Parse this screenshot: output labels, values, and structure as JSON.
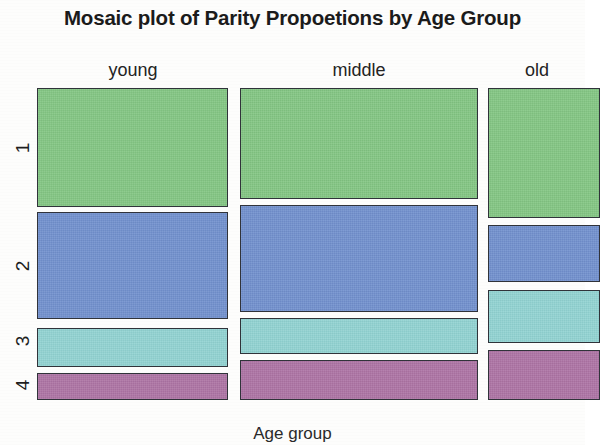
{
  "title": "Mosaic plot of Parity Propoetions by Age Group",
  "x_axis_title": "Age group",
  "columns": [
    {
      "label": "young",
      "label_center_x": 133
    },
    {
      "label": "middle",
      "label_center_x": 359
    },
    {
      "label": "old",
      "label_center_x": 537
    }
  ],
  "rows": [
    {
      "label": "1"
    },
    {
      "label": "2"
    },
    {
      "label": "3"
    },
    {
      "label": "4"
    }
  ],
  "colors": {
    "parity_1": "#83c683",
    "parity_2": "#7190ce",
    "parity_3": "#91d3d2",
    "parity_4": "#ad73a4",
    "tile_border": "#30333a",
    "background": "#fdfdfc",
    "text": "#1b1b1b"
  },
  "chart_data": {
    "type": "bar",
    "chart_kind": "mosaic",
    "title": "Mosaic plot of Parity Propoetions by Age Group",
    "xlabel": "Age group",
    "ylabel": "Parity",
    "categories": [
      "young",
      "middle",
      "old"
    ],
    "row_categories": [
      "1",
      "2",
      "3",
      "4"
    ],
    "column_widths_fraction": [
      0.351,
      0.437,
      0.212
    ],
    "legend": "none",
    "grid": false,
    "series": [
      {
        "name": "1",
        "values": [
          0.385,
          0.358,
          0.417
        ]
      },
      {
        "name": "2",
        "values": [
          0.346,
          0.343,
          0.185
        ]
      },
      {
        "name": "3",
        "values": [
          0.128,
          0.115,
          0.173
        ]
      },
      {
        "name": "4",
        "values": [
          0.087,
          0.129,
          0.161
        ]
      }
    ],
    "tiles": [
      {
        "column": "young",
        "row": "1",
        "color": "#83c683",
        "x": 37,
        "y": 88,
        "width": 191,
        "height": 119
      },
      {
        "column": "young",
        "row": "2",
        "color": "#7190ce",
        "x": 37,
        "y": 212,
        "width": 191,
        "height": 107
      },
      {
        "column": "young",
        "row": "3",
        "color": "#91d3d2",
        "x": 37,
        "y": 328,
        "width": 191,
        "height": 39
      },
      {
        "column": "young",
        "row": "4",
        "color": "#ad73a4",
        "x": 37,
        "y": 373,
        "width": 191,
        "height": 27
      },
      {
        "column": "middle",
        "row": "1",
        "color": "#83c683",
        "x": 240,
        "y": 88,
        "width": 238,
        "height": 111
      },
      {
        "column": "middle",
        "row": "2",
        "color": "#7190ce",
        "x": 240,
        "y": 205,
        "width": 238,
        "height": 107
      },
      {
        "column": "middle",
        "row": "3",
        "color": "#91d3d2",
        "x": 240,
        "y": 318,
        "width": 238,
        "height": 36
      },
      {
        "column": "middle",
        "row": "4",
        "color": "#ad73a4",
        "x": 240,
        "y": 360,
        "width": 238,
        "height": 40
      },
      {
        "column": "old",
        "row": "1",
        "color": "#83c683",
        "x": 488,
        "y": 88,
        "width": 112,
        "height": 130
      },
      {
        "column": "old",
        "row": "2",
        "color": "#7190ce",
        "x": 488,
        "y": 225,
        "width": 112,
        "height": 57
      },
      {
        "column": "old",
        "row": "3",
        "color": "#91d3d2",
        "x": 488,
        "y": 290,
        "width": 112,
        "height": 53
      },
      {
        "column": "old",
        "row": "4",
        "color": "#ad73a4",
        "x": 488,
        "y": 350,
        "width": 112,
        "height": 50
      }
    ],
    "row_label_positions": [
      {
        "label": "1",
        "center_y": 148
      },
      {
        "label": "2",
        "center_y": 266
      },
      {
        "label": "3",
        "center_y": 341
      },
      {
        "label": "4",
        "center_y": 385
      }
    ]
  }
}
